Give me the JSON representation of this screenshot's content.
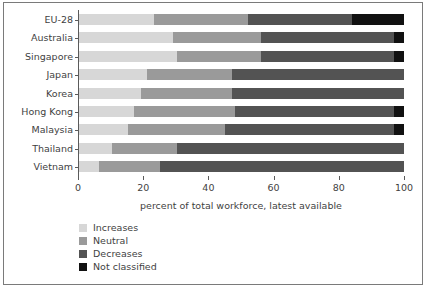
{
  "chart_data": {
    "type": "bar",
    "orientation": "horizontal",
    "stacked": true,
    "title": "",
    "subtitle": "",
    "xlabel": "percent of total workforce, latest available",
    "ylabel": "",
    "xlim": [
      0,
      100
    ],
    "xticks": [
      0,
      20,
      40,
      60,
      80,
      100
    ],
    "xtick_labels": [
      "0",
      "20",
      "40",
      "60",
      "80",
      "100"
    ],
    "grid": false,
    "legend_position": "below-left",
    "categories": [
      "EU-28",
      "Australia",
      "Singapore",
      "Japan",
      "Korea",
      "Hong Kong",
      "Malaysia",
      "Thailand",
      "Vietnam"
    ],
    "series": [
      {
        "name": "Increases",
        "color": "#d7d7d7",
        "values": [
          23,
          29,
          30,
          21,
          19,
          17,
          15,
          10,
          6
        ]
      },
      {
        "name": "Neutral",
        "color": "#9a9a9a",
        "values": [
          29,
          27,
          26,
          26,
          28,
          31,
          30,
          20,
          19
        ]
      },
      {
        "name": "Decreases",
        "color": "#535353",
        "values": [
          32,
          41,
          41,
          53,
          53,
          49,
          52,
          70,
          75
        ]
      },
      {
        "name": "Not classified",
        "color": "#111111",
        "values": [
          16,
          3,
          3,
          0,
          0,
          3,
          3,
          0,
          0
        ]
      }
    ]
  },
  "legend": {
    "items": [
      {
        "label": "Increases",
        "color": "#d7d7d7"
      },
      {
        "label": "Neutral",
        "color": "#9a9a9a"
      },
      {
        "label": "Decreases",
        "color": "#535353"
      },
      {
        "label": "Not classified",
        "color": "#111111"
      }
    ]
  }
}
